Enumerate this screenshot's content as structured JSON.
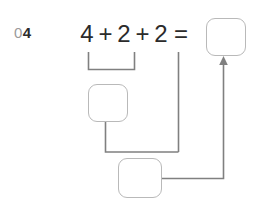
{
  "problem": {
    "number_prefix": "0",
    "number": "4",
    "full_label": "04"
  },
  "equation": {
    "terms": [
      "4",
      "2",
      "2"
    ],
    "operators": [
      "+",
      "+"
    ],
    "equals_sign": "=",
    "expression": "4 + 2 + 2 =",
    "answer": ""
  },
  "work_boxes": {
    "answer_box": "",
    "step_one_box": "",
    "step_two_box": ""
  },
  "style": {
    "ink": "#2b2b2b",
    "box_border": "#b9b9b9",
    "connector": "#808080",
    "muted_text": "#9a9a9a",
    "background": "#ffffff"
  }
}
